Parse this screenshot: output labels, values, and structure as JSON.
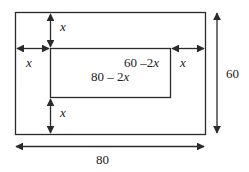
{
  "diagram": {
    "outer": {
      "width_label": "80",
      "height_label": "60"
    },
    "inner": {
      "width_label": "80 – 2x",
      "height_label": "60 –2x"
    },
    "insets": {
      "top": "x",
      "left": "x",
      "right": "x",
      "bottom": "x"
    },
    "colors": {
      "stroke": "#2a2a2a",
      "text": "#222222",
      "background": "#ffffff"
    }
  }
}
